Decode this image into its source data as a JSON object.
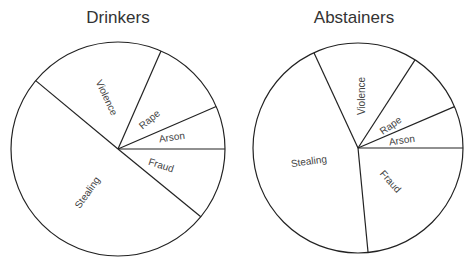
{
  "chart_data": [
    {
      "type": "pie",
      "title": "Drinkers",
      "center": [
        118,
        149
      ],
      "radius": 107,
      "slices": [
        {
          "label": "Arson",
          "start": 0,
          "end": 23.4,
          "percent": 6.5,
          "label_pos": [
            172,
            138
          ],
          "label_rot": -8
        },
        {
          "label": "Rape",
          "start": 23.4,
          "end": 66.3,
          "percent": 11.9,
          "label_pos": [
            150,
            120
          ],
          "label_rot": -40
        },
        {
          "label": "Violence",
          "start": 66.3,
          "end": 140.3,
          "percent": 20.6,
          "label_pos": [
            106,
            98
          ],
          "label_rot": 65
        },
        {
          "label": "Stealing",
          "start": 140.3,
          "end": 320.7,
          "percent": 50.1,
          "label_pos": [
            88,
            193
          ],
          "label_rot": -55
        },
        {
          "label": "Fraud",
          "start": 320.7,
          "end": 360,
          "percent": 10.9,
          "label_pos": [
            161,
            166
          ],
          "label_rot": 18
        }
      ]
    },
    {
      "type": "pie",
      "title": "Abstainers",
      "center": [
        358,
        148
      ],
      "radius": 105,
      "slices": [
        {
          "label": "Arson",
          "start": 0,
          "end": 23.2,
          "percent": 6.4,
          "label_pos": [
            402,
            141
          ],
          "label_rot": -8
        },
        {
          "label": "Rape",
          "start": 23.2,
          "end": 57.1,
          "percent": 9.4,
          "label_pos": [
            391,
            126
          ],
          "label_rot": -35
        },
        {
          "label": "Violence",
          "start": 57.1,
          "end": 114.8,
          "percent": 16.0,
          "label_pos": [
            362,
            96
          ],
          "label_rot": -90
        },
        {
          "label": "Stealing",
          "start": 114.8,
          "end": 275.5,
          "percent": 44.6,
          "label_pos": [
            309,
            162
          ],
          "label_rot": -8
        },
        {
          "label": "Fraud",
          "start": 275.5,
          "end": 360,
          "percent": 23.5,
          "label_pos": [
            390,
            182
          ],
          "label_rot": 48
        }
      ]
    }
  ]
}
